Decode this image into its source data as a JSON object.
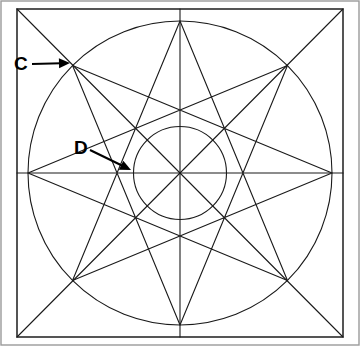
{
  "figure": {
    "canvas": {
      "width": 360,
      "height": 346,
      "background": "#ffffff"
    },
    "stroke_color": "#1a1a1a",
    "frame_color": "#2b2b2b",
    "outer_frame_color": "#9a9a9a",
    "label_color": "#000000"
  },
  "square": {
    "name": "bounding-square",
    "x": 17,
    "y": 9,
    "width": 326,
    "height": 328
  },
  "outer_frame": {
    "name": "image-border",
    "x": 1,
    "y": 1,
    "width": 358,
    "height": 344
  },
  "circumcircle": {
    "name": "outer-circle",
    "cx": 180,
    "cy": 173,
    "r": 152
  },
  "incircle": {
    "name": "inner-circle",
    "cx": 180,
    "cy": 173,
    "r": 46.5
  },
  "star": {
    "type": "star-polygon",
    "schlafli": "{8/3}",
    "points": 8,
    "step": 3,
    "outer_radius": 152,
    "inner_radius": 46.5,
    "start_angle_deg": -90,
    "vertex_labels": [
      "top",
      "upper-right",
      "right",
      "lower-right",
      "bottom",
      "lower-left",
      "left",
      "upper-left"
    ]
  },
  "axes": {
    "name": "axis-lines",
    "vertical": {
      "x": 180,
      "y1": 9,
      "y2": 337
    },
    "horizontal": {
      "y": 173,
      "x1": 17,
      "x2": 343
    },
    "diagonal_1": {
      "x1": 17,
      "y1": 9,
      "x2": 343,
      "y2": 337
    },
    "diagonal_2": {
      "x1": 343,
      "y1": 9,
      "x2": 17,
      "y2": 337
    }
  },
  "annotations": [
    {
      "id": "label-c",
      "text": "C",
      "label_x": 14,
      "label_y": 65,
      "arrow_from": {
        "x": 32,
        "y": 64
      },
      "arrow_to": {
        "x": 70,
        "y": 63
      },
      "describes": "upper-left star vertex on the circumcircle"
    },
    {
      "id": "label-d",
      "text": "D",
      "label_x": 74,
      "label_y": 149,
      "arrow_from": {
        "x": 90,
        "y": 150
      },
      "arrow_to": {
        "x": 131,
        "y": 170
      },
      "describes": "inner vertex of the star on the incircle at the left"
    }
  ]
}
